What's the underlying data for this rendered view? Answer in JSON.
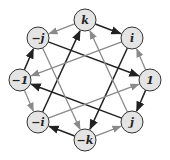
{
  "diagram": {
    "title": "",
    "nodes": [
      {
        "id": "k",
        "label": "k",
        "x": 85,
        "y": 20
      },
      {
        "id": "i",
        "label": "i",
        "x": 132,
        "y": 38
      },
      {
        "id": "1",
        "label": "1",
        "x": 150,
        "y": 80
      },
      {
        "id": "j",
        "label": "j",
        "x": 132,
        "y": 122
      },
      {
        "id": "-k",
        "label": "−k",
        "x": 85,
        "y": 140
      },
      {
        "id": "-i",
        "label": "−i",
        "x": 38,
        "y": 122
      },
      {
        "id": "-1",
        "label": "−1",
        "x": 20,
        "y": 80
      },
      {
        "id": "-j",
        "label": "−j",
        "x": 38,
        "y": 38
      }
    ],
    "edges": [
      {
        "from": "k",
        "to": "i",
        "type": "dark"
      },
      {
        "from": "1",
        "to": "j",
        "type": "dark"
      },
      {
        "from": "-k",
        "to": "-i",
        "type": "dark"
      },
      {
        "from": "-1",
        "to": "-j",
        "type": "dark"
      },
      {
        "from": "-j",
        "to": "1",
        "type": "dark"
      },
      {
        "from": "i",
        "to": "-k",
        "type": "dark"
      },
      {
        "from": "-i",
        "to": "k",
        "type": "dark"
      },
      {
        "from": "j",
        "to": "-1",
        "type": "dark"
      },
      {
        "from": "k",
        "to": "-j",
        "type": "gray"
      },
      {
        "from": "1",
        "to": "i",
        "type": "gray"
      },
      {
        "from": "-k",
        "to": "j",
        "type": "gray"
      },
      {
        "from": "-1",
        "to": "-i",
        "type": "gray"
      },
      {
        "from": "i",
        "to": "-1",
        "type": "gray"
      },
      {
        "from": "-i",
        "to": "1",
        "type": "gray"
      },
      {
        "from": "j",
        "to": "k",
        "type": "gray"
      },
      {
        "from": "-j",
        "to": "-k",
        "type": "gray"
      }
    ],
    "colors": {
      "dark": "#222222",
      "gray": "#8a8a8a",
      "node_fill": "#e4e4e4"
    }
  }
}
